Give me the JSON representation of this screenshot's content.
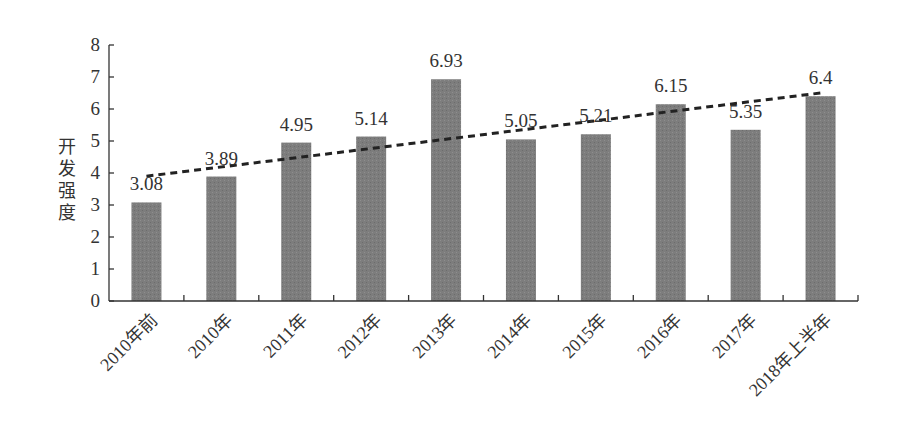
{
  "chart_data": {
    "type": "bar",
    "title": "",
    "xlabel": "",
    "ylabel": "开发强度",
    "ylim": [
      0,
      8
    ],
    "yticks": [
      0,
      1,
      2,
      3,
      4,
      5,
      6,
      7,
      8
    ],
    "grid": false,
    "legend": null,
    "categories": [
      "2010年前",
      "2010年",
      "2011年",
      "2012年",
      "2013年",
      "2014年",
      "2015年",
      "2016年",
      "2017年",
      "2018年上半年"
    ],
    "values": [
      3.08,
      3.89,
      4.95,
      5.14,
      6.93,
      5.05,
      5.21,
      6.15,
      5.35,
      6.4
    ],
    "data_labels": [
      "3.08",
      "3.89",
      "4.95",
      "5.14",
      "6.93",
      "5.05",
      "5.21",
      "6.15",
      "5.35",
      "6.4"
    ],
    "trendline": {
      "type": "linear",
      "style": "dashed",
      "start": 3.9,
      "end": 6.5
    },
    "colors": {
      "bar": "#7d7d7d",
      "axis": "#333333",
      "trend": "#222222",
      "text": "#333333"
    }
  }
}
